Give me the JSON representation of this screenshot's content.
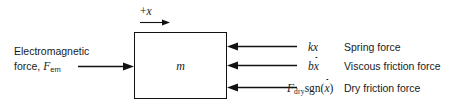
{
  "diagram": {
    "axis": {
      "label_sign": "+",
      "label_var": "x",
      "arrow_direction": "right"
    },
    "mass": {
      "symbol": "m"
    },
    "input_force": {
      "line1": "Electromagnetic",
      "line2_prefix": "force, ",
      "line2_symbol": "F",
      "line2_subscript": "em",
      "arrow_direction": "right"
    },
    "reaction_forces": [
      {
        "math_prefix": "k",
        "math_var": "x",
        "math_plain": "kx",
        "description": "Spring force",
        "arrow_direction": "left"
      },
      {
        "math_prefix": "b",
        "math_var": "x",
        "math_dot": true,
        "math_plain": "bẋ",
        "description": "Viscous friction force",
        "arrow_direction": "left"
      },
      {
        "math_symbol": "F",
        "math_subscript": "dry",
        "math_function": "sgn(",
        "math_var": "x",
        "math_dot": true,
        "math_close": ")",
        "math_plain": "F_dry sgn(ẋ)",
        "description": "Dry friction force",
        "arrow_direction": "left"
      }
    ],
    "colors": {
      "background": "#ffffff",
      "stroke": "#111111",
      "text": "#1a1a1a"
    }
  }
}
